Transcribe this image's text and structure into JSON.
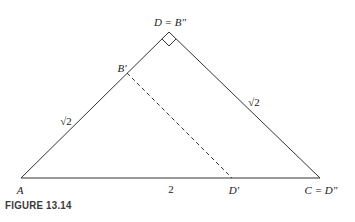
{
  "figure": {
    "caption": "FIGURE 13.14"
  },
  "points": {
    "apex": {
      "label": "D = B″",
      "x": 169,
      "y": 32
    },
    "A": {
      "label": "A",
      "x": 21,
      "y": 178
    },
    "C": {
      "label": "C = D″",
      "x": 320,
      "y": 178
    },
    "B_prime": {
      "label": "B′",
      "x": 127,
      "y": 73
    },
    "D_prime": {
      "label": "D′",
      "x": 232,
      "y": 178
    }
  },
  "labels": {
    "apex": "D = B″",
    "a": "A",
    "c": "C = D″",
    "b_prime": "B′",
    "d_prime": "D′",
    "left_side": "√2",
    "right_side": "√2",
    "base": "2"
  },
  "annotations": {
    "right_angle_at": "apex",
    "dashed_segment": [
      "B′",
      "D′"
    ]
  },
  "colors": {
    "line": "#333333",
    "text": "#222222",
    "caption": "#3a3a3a"
  }
}
